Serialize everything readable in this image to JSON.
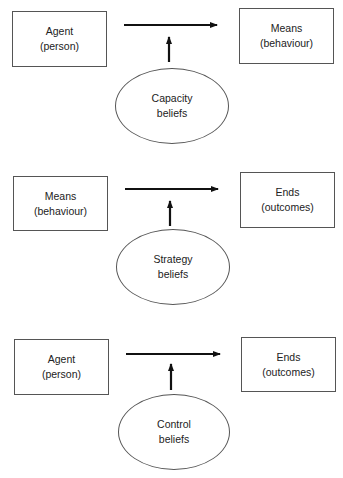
{
  "diagrams": [
    {
      "left": {
        "line1": "Agent",
        "line2": "(person)"
      },
      "right": {
        "line1": "Means",
        "line2": "(behaviour)"
      },
      "belief": {
        "line1": "Capacity",
        "line2": "beliefs"
      }
    },
    {
      "left": {
        "line1": "Means",
        "line2": "(behaviour)"
      },
      "right": {
        "line1": "Ends",
        "line2": "(outcomes)"
      },
      "belief": {
        "line1": "Strategy",
        "line2": "beliefs"
      }
    },
    {
      "left": {
        "line1": "Agent",
        "line2": "(person)"
      },
      "right": {
        "line1": "Ends",
        "line2": "(outcomes)"
      },
      "belief": {
        "line1": "Control",
        "line2": "beliefs"
      }
    }
  ],
  "colors": {
    "stroke": "#555555",
    "arrow": "#111111",
    "text": "#222222",
    "background": "#ffffff"
  }
}
